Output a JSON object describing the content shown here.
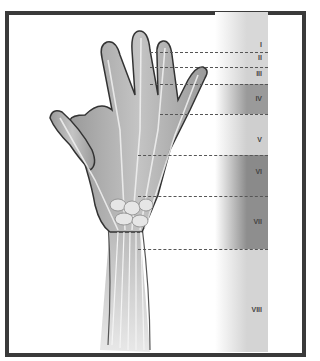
{
  "figure": {
    "title": "",
    "frame_color": "#3a3a3a"
  },
  "zones": [
    {
      "label": "I",
      "top": 12,
      "bottom": 52,
      "shade": "#d8d8d8",
      "label_y": 45
    },
    {
      "label": "II",
      "top": 52,
      "bottom": 67,
      "shade": "#d6d6d6",
      "label_y": 58
    },
    {
      "label": "III",
      "top": 67,
      "bottom": 84,
      "shade": "#d2d2d2",
      "label_y": 74
    },
    {
      "label": "IV",
      "top": 84,
      "bottom": 114,
      "shade": "#9a9a9a",
      "label_y": 99
    },
    {
      "label": "V",
      "top": 114,
      "bottom": 155,
      "shade": "#cfcfcf",
      "label_y": 140
    },
    {
      "label": "VI",
      "top": 155,
      "bottom": 196,
      "shade": "#8a8a8a",
      "label_y": 172
    },
    {
      "label": "VII",
      "top": 196,
      "bottom": 249,
      "shade": "#8e8e8e",
      "label_y": 222
    },
    {
      "label": "VIII",
      "top": 249,
      "bottom": 352,
      "shade": "#d4d4d4",
      "label_y": 310
    }
  ],
  "boundaries": [
    {
      "y": 52,
      "x_start": 150
    },
    {
      "y": 67,
      "x_start": 150
    },
    {
      "y": 84,
      "x_start": 150
    },
    {
      "y": 114,
      "x_start": 160
    },
    {
      "y": 155,
      "x_start": 138
    },
    {
      "y": 196,
      "x_start": 138
    },
    {
      "y": 249,
      "x_start": 138
    }
  ]
}
